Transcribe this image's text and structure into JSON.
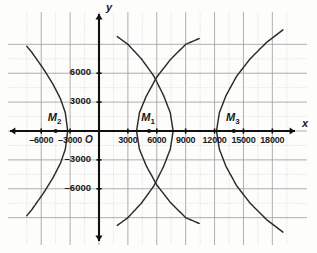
{
  "figure": {
    "kind": "coordinate-graph",
    "background_color": "#fdfdfc",
    "grid_minor_color": "#c9c9c9",
    "grid_major_color": "#9a9a9a",
    "axis_color": "#111111",
    "curve_color": "#2b2b2b"
  },
  "axes": {
    "x_name": "x",
    "y_name": "y",
    "origin_label": "O",
    "x_range": [
      -7500,
      19500
    ],
    "y_range": [
      -9000,
      9000
    ],
    "x_ticks": [
      {
        "value": -6000,
        "label": "–6000"
      },
      {
        "value": -3000,
        "label": "–3000"
      },
      {
        "value": 3000,
        "label": "3000"
      },
      {
        "value": 6000,
        "label": "6000"
      },
      {
        "value": 9000,
        "label": "9000"
      },
      {
        "value": 12000,
        "label": "12000"
      },
      {
        "value": 15000,
        "label": "15000"
      },
      {
        "value": 18000,
        "label": "18000"
      }
    ],
    "y_ticks": [
      {
        "value": 6000,
        "label": "6000"
      },
      {
        "value": 3000,
        "label": "3000"
      },
      {
        "value": -3000,
        "label": "–3000"
      },
      {
        "value": -6000,
        "label": "–6000"
      }
    ],
    "grid_step": 1500,
    "major_every": 2
  },
  "chart_data": {
    "type": "line",
    "title": "",
    "xlabel": "x",
    "ylabel": "y",
    "xlim": [
      -7500,
      19500
    ],
    "ylim": [
      -9000,
      9000
    ],
    "grid": true,
    "legend": "none",
    "points": [
      {
        "name": "M_1",
        "label": "M",
        "sub": "1",
        "x": 5200,
        "y": 0
      },
      {
        "name": "M_2",
        "label": "M",
        "sub": "2",
        "x": -4500,
        "y": 0
      },
      {
        "name": "M_3",
        "label": "M",
        "sub": "3",
        "x": 14000,
        "y": 0
      }
    ],
    "series": [
      {
        "name": "branch-left-opening-near-M2",
        "orientation": "opens-left",
        "vertex": [
          -3250,
          0
        ],
        "x": [
          -3250,
          -3500,
          -4000,
          -4800,
          -5800,
          -7000,
          -7500
        ],
        "y_upper": [
          0,
          1900,
          3350,
          4900,
          6500,
          8200,
          8800
        ],
        "y_lower": [
          0,
          -1900,
          -3350,
          -4900,
          -6500,
          -8200,
          -8800
        ]
      },
      {
        "name": "branch-right-opening-at-3900",
        "orientation": "opens-right",
        "vertex": [
          3900,
          0
        ],
        "x": [
          3900,
          4200,
          4900,
          6000,
          7400,
          9000,
          10400
        ],
        "y_upper": [
          0,
          1900,
          3600,
          5600,
          7400,
          9000,
          9600
        ],
        "y_lower": [
          0,
          -1900,
          -3600,
          -5600,
          -7400,
          -9000,
          -9600
        ]
      },
      {
        "name": "branch-left-opening-at-7700",
        "orientation": "opens-left",
        "vertex": [
          7700,
          0
        ],
        "x": [
          7700,
          7400,
          6700,
          5700,
          4400,
          3000,
          1900
        ],
        "y_upper": [
          0,
          1900,
          3700,
          5700,
          7500,
          9000,
          9800
        ],
        "y_lower": [
          0,
          -1900,
          -3700,
          -5700,
          -7500,
          -9000,
          -9800
        ]
      },
      {
        "name": "branch-right-opening-at-12200",
        "orientation": "opens-right",
        "vertex": [
          12200,
          0
        ],
        "x": [
          12200,
          12500,
          13200,
          14300,
          15700,
          17400,
          19100
        ],
        "y_upper": [
          0,
          1900,
          3700,
          5700,
          7500,
          9200,
          10500
        ],
        "y_lower": [
          0,
          -1900,
          -3700,
          -5700,
          -7500,
          -9200,
          -10500
        ]
      }
    ],
    "annotations": [
      {
        "text": "M₁",
        "x": 5200,
        "y": 900
      },
      {
        "text": "M₂",
        "x": -4500,
        "y": 900
      },
      {
        "text": "M₃",
        "x": 14000,
        "y": 900
      }
    ]
  }
}
